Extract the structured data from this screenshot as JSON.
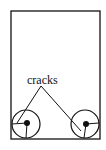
{
  "diagram": {
    "label": "cracks",
    "stroke_color": "#111111",
    "background": "#ffffff",
    "container": {
      "x": 11,
      "y": 11,
      "width": 89,
      "height": 128
    },
    "wheels": [
      {
        "name": "left",
        "cx": 26,
        "cy": 124,
        "r": 14
      },
      {
        "name": "right",
        "cx": 85,
        "cy": 124,
        "r": 14
      }
    ]
  }
}
